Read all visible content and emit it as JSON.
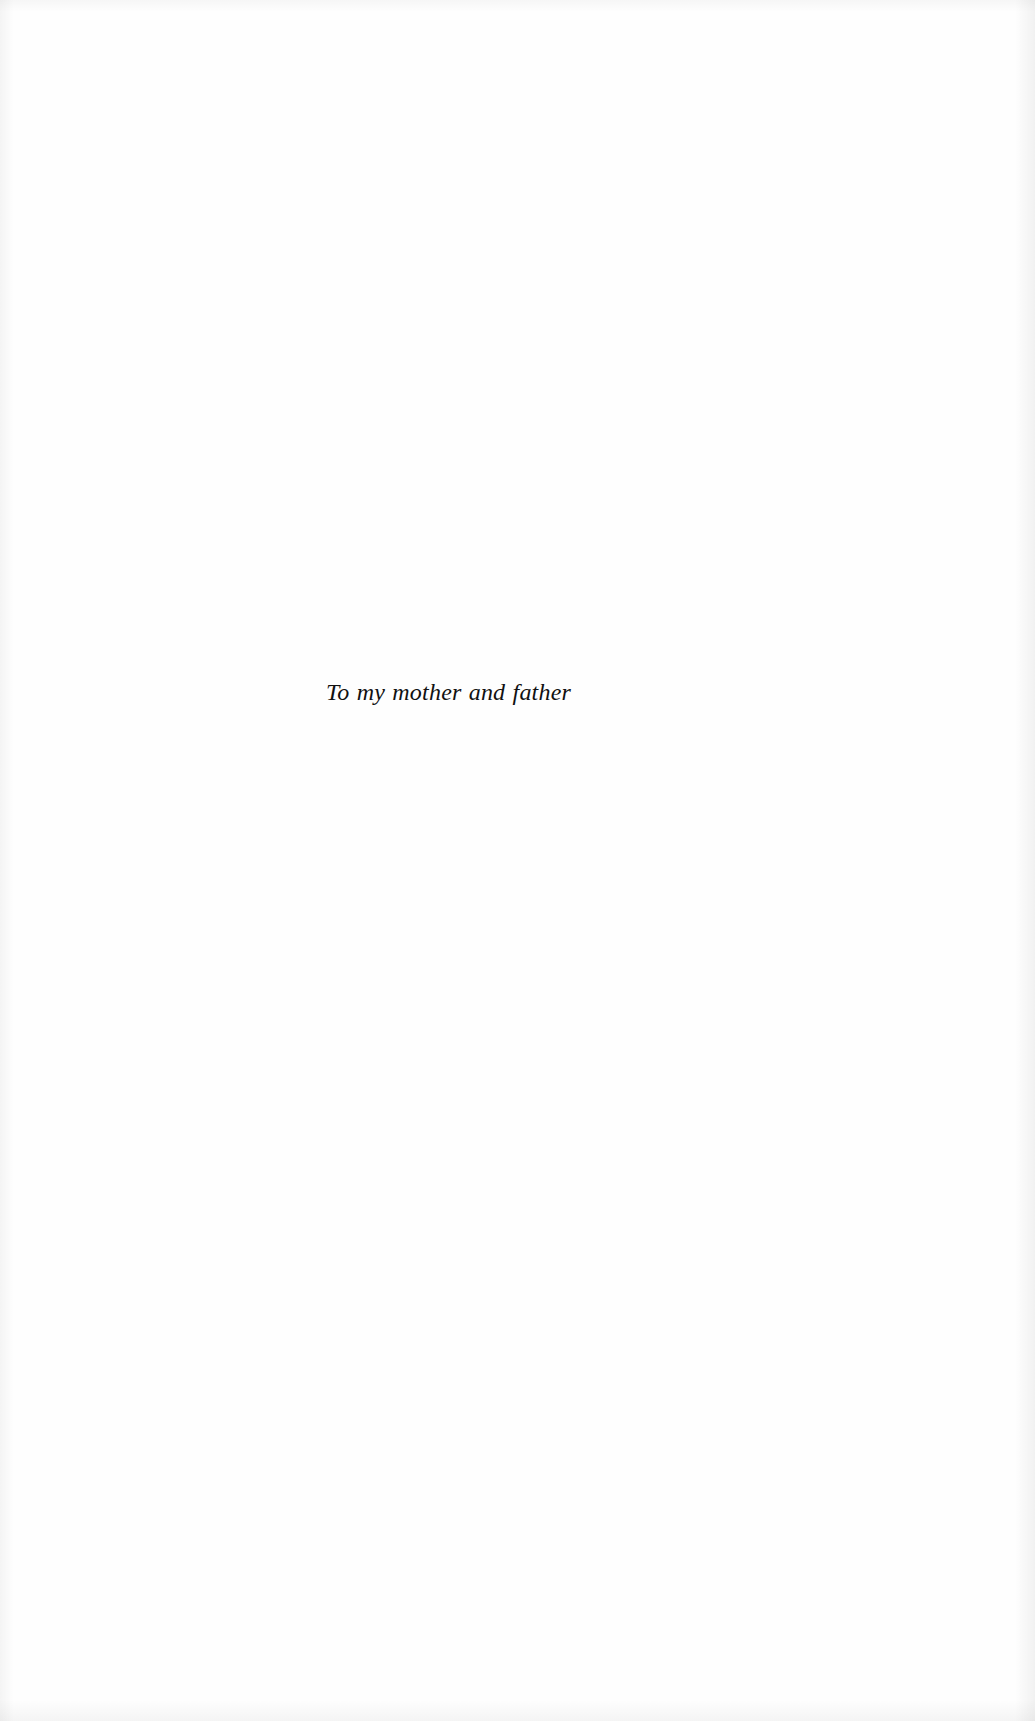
{
  "page": {
    "type": "book-dedication-page",
    "background_color": "#fefefe",
    "text_color": "#111111"
  },
  "dedication": {
    "text": "To my mother and father"
  }
}
